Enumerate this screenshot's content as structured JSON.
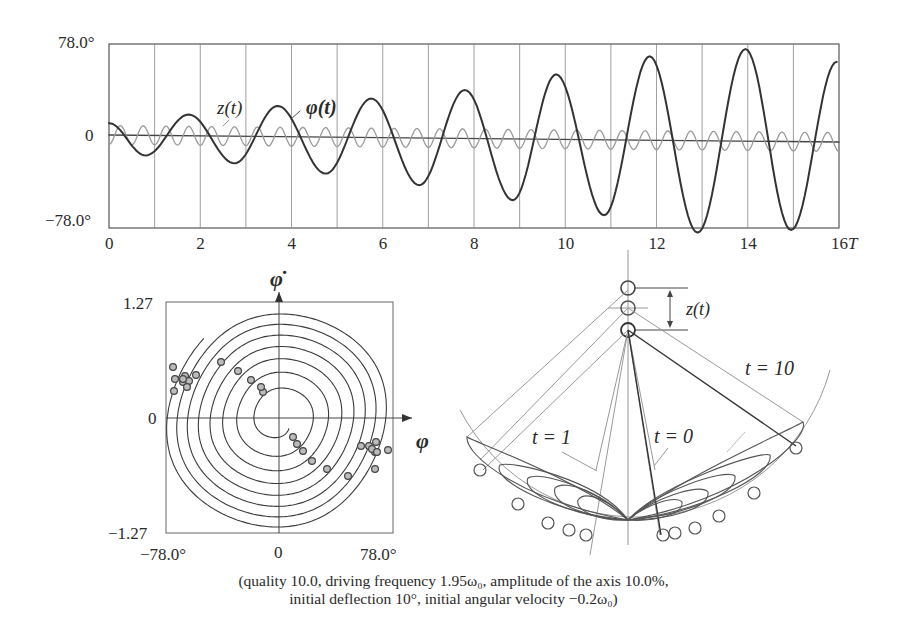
{
  "time_plot": {
    "y_max_label": "78.0°",
    "y_zero_label": "0",
    "y_min_label": "−78.0°",
    "x_ticks": [
      "0",
      "2",
      "4",
      "6",
      "8",
      "10",
      "12",
      "14",
      "16T"
    ],
    "curve_labels": {
      "z": "z(t)",
      "phi": "φ(t)"
    }
  },
  "phase_plot": {
    "y_axis_label": "φ̇",
    "x_axis_label": "φ",
    "y_max_label": "1.27",
    "y_zero_label": "0",
    "y_min_label": "−1.27",
    "x_min_label": "−78.0°",
    "x_zero_label": "0",
    "x_max_label": "78.0°"
  },
  "pendulum_diagram": {
    "z_label": "z(t)",
    "t10_label": "t = 10",
    "t1_label": "t = 1",
    "t0_label": "t = 0"
  },
  "caption": {
    "line1": "(quality 10.0, driving frequency 1.95ω₀, amplitude of the axis 10.0%,",
    "line2": "initial deflection 10°, initial angular velocity −0.2ω₀)"
  },
  "chart_data": [
    {
      "type": "line",
      "title": "Parametric pendulum: angle and axis displacement vs time",
      "xlabel": "t (periods T)",
      "ylabel": "deflection",
      "xlim": [
        0,
        16
      ],
      "ylim": [
        -78.0,
        78.0
      ],
      "x_ticks": [
        0,
        2,
        4,
        6,
        8,
        10,
        12,
        14,
        16
      ],
      "grid": "vertical lines every 1T",
      "series": [
        {
          "name": "φ(t)",
          "x": [
            0,
            0.8,
            1.75,
            2.75,
            3.7,
            4.75,
            5.75,
            6.8,
            7.8,
            8.85,
            9.8,
            10.85,
            11.85,
            12.9,
            13.95,
            14.95,
            15.95
          ],
          "values": [
            10,
            -17,
            18,
            -23,
            26,
            -31,
            33,
            -40,
            41,
            -52,
            55,
            -64,
            71,
            -78,
            78,
            -75,
            68
          ]
        },
        {
          "name": "z(t)",
          "description": "small sinusoid, ~2 oscillations per T, amplitude ~10% of range",
          "amplitude_approx": 8,
          "period_T": 0.5
        }
      ]
    },
    {
      "type": "scatter",
      "title": "Phase portrait",
      "xlabel": "φ",
      "ylabel": "φ̇",
      "xlim": [
        -78.0,
        78.0
      ],
      "ylim": [
        -1.27,
        1.27
      ],
      "description": "outward spiral trajectory from near origin to large closed loops; sample points marked with small circles clustered near φ≈±70°"
    }
  ]
}
